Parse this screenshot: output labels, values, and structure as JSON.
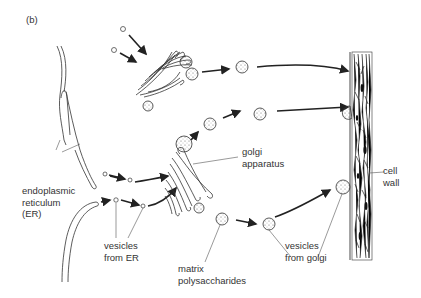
{
  "panel_label": "(b)",
  "labels": {
    "er": [
      "endoplasmic",
      "reticulum",
      "(ER)"
    ],
    "golgi": [
      "golgi",
      "apparatus"
    ],
    "vesicles_er": [
      "vesicles",
      "from ER"
    ],
    "matrix": [
      "matrix",
      "polysaccharides"
    ],
    "vesicles_golgi": [
      "vesicles",
      "from golgi"
    ],
    "cell_wall": [
      "cell",
      "wall"
    ]
  },
  "colors": {
    "ink": "#222222",
    "text": "#333333",
    "background": "#ffffff"
  }
}
